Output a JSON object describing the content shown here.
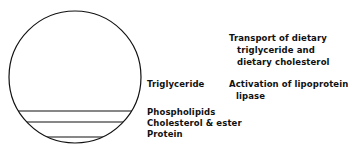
{
  "diagram": {
    "particle_labels": {
      "triglyceride": "Triglyceride",
      "phospholipids": "Phospholipids",
      "cholesterol": "Cholesterol & ester",
      "protein": "Protein"
    },
    "functions": {
      "f1_line1": "Transport of dietary",
      "f1_line2": "triglyceride  and",
      "f1_line3": "dietary cholesterol",
      "f2_line1": "Activation of lipoprotein",
      "f2_line2": "lipase"
    }
  }
}
